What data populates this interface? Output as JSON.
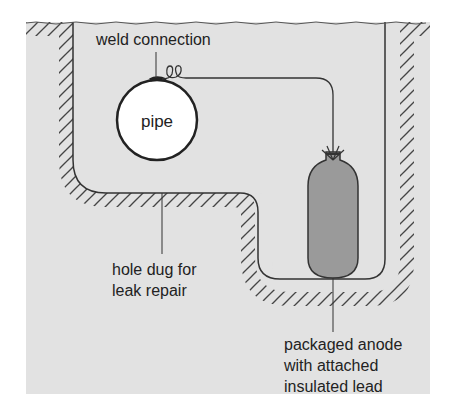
{
  "diagram": {
    "labels": {
      "weld": "weld connection",
      "pipe": "pipe",
      "hole_line1": "hole dug for",
      "hole_line2": "leak repair",
      "anode_line1": "packaged anode",
      "anode_line2": "with attached",
      "anode_line3": "insulated lead"
    },
    "colors": {
      "soil_background": "#e2e2e2",
      "outline": "#333333",
      "anode_fill": "#9a9a9a",
      "pipe_fill": "#ffffff",
      "text": "#222222"
    },
    "components": [
      "soil",
      "excavated hole",
      "pipe",
      "weld connection",
      "insulated lead wire",
      "packaged anode"
    ]
  }
}
